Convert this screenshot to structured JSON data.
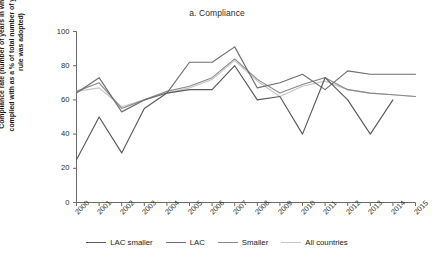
{
  "chart_data": {
    "type": "line",
    "title": "a. Compliance",
    "xlabel": "",
    "ylabel": "Compliance rate (number of years in which a rule was complied with as a % of total number of years since the rule was adopted)",
    "x": [
      "2000",
      "2001",
      "2002",
      "2003",
      "2004",
      "2005",
      "2006",
      "2007",
      "2008",
      "2009",
      "2010",
      "2011",
      "2012",
      "2013",
      "2014",
      "2015"
    ],
    "ylim": [
      0,
      100
    ],
    "xlim": [
      "2000",
      "2015"
    ],
    "yticks": [
      "0",
      "20",
      "40",
      "60",
      "80",
      "100"
    ],
    "grid": false,
    "legend_position": "bottom",
    "series": [
      {
        "name": "LAC smaller",
        "color": "#5a5a5a",
        "values": [
          25,
          50,
          29,
          55,
          64,
          66,
          66,
          80,
          60,
          62,
          40,
          73,
          60,
          40,
          60,
          null
        ]
      },
      {
        "name": "LAC",
        "color": "#6e6e6e",
        "values": [
          64,
          73,
          53,
          60,
          64,
          82,
          82,
          91,
          67,
          70,
          75,
          66,
          77,
          75,
          75,
          75
        ]
      },
      {
        "name": "Smaller",
        "color": "#8a8a8a",
        "values": [
          65,
          70,
          55,
          60,
          65,
          68,
          73,
          84,
          72,
          64,
          69,
          73,
          66,
          64,
          63,
          62
        ]
      },
      {
        "name": "All countries",
        "color": "#c6c6c6",
        "values": [
          65,
          67,
          56,
          60,
          64,
          67,
          72,
          83,
          71,
          62,
          68,
          71,
          66,
          64,
          63,
          62
        ]
      }
    ]
  },
  "chart": {
    "title": "a. Compliance",
    "ylabel": "Compliance rate (number of years in which a rule was complied with as a % of total number of years since the rule was adopted)"
  }
}
